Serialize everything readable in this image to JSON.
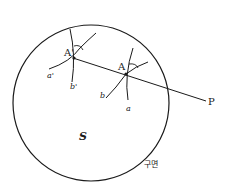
{
  "diagram": {
    "type": "geometry",
    "labels": {
      "point_A": "A",
      "point_A_prime": "A'",
      "point_P": "P",
      "curve_a": "a",
      "curve_b": "b",
      "curve_a_prime": "a'",
      "curve_b_prime": "b'",
      "sphere": "S",
      "surface": "구면"
    },
    "colors": {
      "stroke": "#1a1a1a",
      "background": "#ffffff"
    }
  }
}
